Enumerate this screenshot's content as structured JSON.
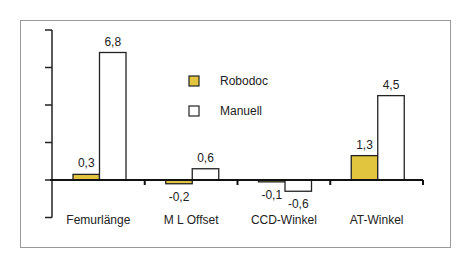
{
  "chart_data": {
    "type": "bar",
    "title": "",
    "xlabel": "",
    "ylabel": "",
    "categories": [
      "Femurlänge",
      "M L Offset",
      "CCD-Winkel",
      "AT-Winkel"
    ],
    "series": [
      {
        "name": "Robodoc",
        "values": [
          0.3,
          -0.2,
          -0.1,
          1.3
        ],
        "color": "#e2c53f"
      },
      {
        "name": "Manuell",
        "values": [
          6.8,
          0.6,
          -0.6,
          4.5
        ],
        "color": "#ffffff"
      }
    ],
    "data_labels": {
      "Robodoc": [
        "0,3",
        "-0,2",
        "-0,1",
        "1,3"
      ],
      "Manuell": [
        "6,8",
        "0,6",
        "-0,6",
        "4,5"
      ]
    },
    "ylim": [
      -2,
      8
    ],
    "y_ticks": [
      -2,
      0,
      2,
      4,
      6,
      8
    ],
    "y_tick_labels_visible": false,
    "grid": false,
    "legend_position": "inside-top-center"
  },
  "legend": {
    "items": [
      {
        "label": "Robodoc",
        "color": "#e2c53f"
      },
      {
        "label": "Manuell",
        "color": "#ffffff"
      }
    ]
  }
}
